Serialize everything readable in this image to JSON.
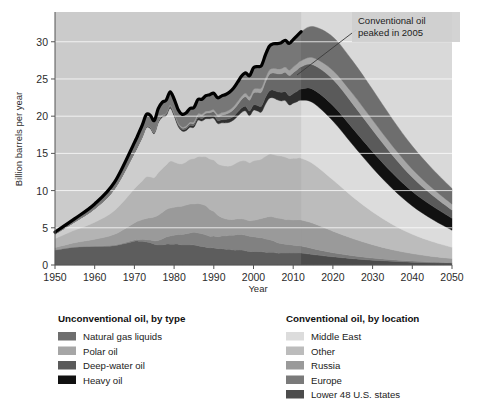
{
  "figure": {
    "background": "#ffffff",
    "plot_background": "#d9d9d9"
  },
  "chart_data": {
    "type": "area",
    "stacking": "stacked",
    "title": "",
    "xlabel": "Year",
    "ylabel": "Billion barrels per year",
    "xlim": [
      1950,
      2050
    ],
    "ylim": [
      0,
      34
    ],
    "xticks": [
      1950,
      1960,
      1970,
      1980,
      1990,
      2000,
      2010,
      2020,
      2030,
      2040,
      2050
    ],
    "yticks": [
      0,
      5,
      10,
      15,
      20,
      25,
      30
    ],
    "grid": "horizontal-white",
    "legend_position": "below-plot-two-columns",
    "x": [
      1950,
      1955,
      1960,
      1965,
      1970,
      1971,
      1972,
      1973,
      1974,
      1975,
      1976,
      1977,
      1978,
      1979,
      1980,
      1981,
      1982,
      1983,
      1984,
      1985,
      1986,
      1987,
      1988,
      1989,
      1990,
      1991,
      1992,
      1993,
      1994,
      1995,
      1996,
      1997,
      1998,
      1999,
      2000,
      2001,
      2002,
      2003,
      2004,
      2005,
      2006,
      2007,
      2008,
      2009,
      2010,
      2011,
      2012,
      2015,
      2020,
      2025,
      2030,
      2035,
      2040,
      2045,
      2050
    ],
    "series": [
      {
        "name": "Lower 48 U.S. states",
        "group": "Conventional oil, by location",
        "color": "#4c4c4c",
        "values": [
          2.0,
          2.4,
          2.5,
          2.6,
          3.2,
          3.2,
          3.2,
          3.1,
          3.0,
          2.8,
          2.7,
          2.7,
          2.8,
          2.8,
          2.8,
          2.8,
          2.7,
          2.7,
          2.7,
          2.7,
          2.6,
          2.5,
          2.4,
          2.3,
          2.3,
          2.2,
          2.2,
          2.1,
          2.1,
          2.0,
          2.0,
          2.0,
          1.9,
          1.8,
          1.8,
          1.8,
          1.8,
          1.7,
          1.7,
          1.7,
          1.6,
          1.6,
          1.6,
          1.6,
          1.6,
          1.6,
          1.6,
          1.4,
          1.1,
          0.85,
          0.65,
          0.5,
          0.38,
          0.3,
          0.25
        ]
      },
      {
        "name": "Europe",
        "group": "Conventional oil, by location",
        "color": "#7a7a7a",
        "values": [
          0.05,
          0.05,
          0.06,
          0.08,
          0.15,
          0.2,
          0.25,
          0.3,
          0.35,
          0.45,
          0.6,
          0.8,
          0.95,
          1.1,
          1.2,
          1.3,
          1.4,
          1.5,
          1.6,
          1.7,
          1.7,
          1.7,
          1.65,
          1.55,
          1.6,
          1.6,
          1.7,
          1.8,
          1.9,
          2.0,
          2.1,
          2.1,
          2.1,
          2.05,
          2.0,
          1.9,
          1.85,
          1.8,
          1.7,
          1.55,
          1.4,
          1.3,
          1.2,
          1.15,
          1.05,
          1.0,
          0.95,
          0.8,
          0.55,
          0.4,
          0.28,
          0.2,
          0.15,
          0.1,
          0.08
        ]
      },
      {
        "name": "Russia",
        "group": "Conventional oil, by location",
        "color": "#9a9a9a",
        "values": [
          0.3,
          0.55,
          0.9,
          1.45,
          2.3,
          2.5,
          2.65,
          2.85,
          3.0,
          3.2,
          3.4,
          3.55,
          3.7,
          3.75,
          3.75,
          3.75,
          3.8,
          3.85,
          3.9,
          3.8,
          3.95,
          3.95,
          3.9,
          3.6,
          3.3,
          2.9,
          2.5,
          2.3,
          2.1,
          2.1,
          2.1,
          2.1,
          2.1,
          2.1,
          2.2,
          2.4,
          2.6,
          2.9,
          3.1,
          3.2,
          3.3,
          3.35,
          3.3,
          3.35,
          3.4,
          3.45,
          3.5,
          3.4,
          2.9,
          2.3,
          1.8,
          1.35,
          1.0,
          0.75,
          0.55
        ]
      },
      {
        "name": "Other",
        "group": "Conventional oil, by location",
        "color": "#bcbcbc",
        "values": [
          1.2,
          1.7,
          2.3,
          3.2,
          4.6,
          4.9,
          5.2,
          5.6,
          5.5,
          5.3,
          5.7,
          5.9,
          6.0,
          6.3,
          6.1,
          5.8,
          5.7,
          5.8,
          6.0,
          6.1,
          6.3,
          6.4,
          6.6,
          6.8,
          6.9,
          6.9,
          7.0,
          7.1,
          7.2,
          7.4,
          7.6,
          7.8,
          7.9,
          7.8,
          8.0,
          8.0,
          8.0,
          8.2,
          8.4,
          8.4,
          8.4,
          8.4,
          8.4,
          8.2,
          8.3,
          8.3,
          8.3,
          8.0,
          6.9,
          5.6,
          4.4,
          3.4,
          2.6,
          2.0,
          1.5
        ]
      },
      {
        "name": "Middle East",
        "group": "Conventional oil, by location",
        "color": "#dcdcdc",
        "values": [
          0.6,
          1.1,
          1.8,
          2.9,
          4.8,
          5.3,
          5.9,
          6.6,
          6.5,
          5.9,
          6.7,
          6.9,
          6.6,
          7.1,
          6.2,
          5.0,
          4.4,
          4.2,
          4.3,
          4.2,
          4.9,
          4.8,
          5.1,
          5.4,
          5.6,
          5.4,
          5.7,
          5.8,
          5.9,
          6.0,
          6.2,
          6.5,
          6.7,
          6.3,
          6.8,
          6.6,
          6.3,
          7.0,
          7.5,
          7.6,
          7.5,
          7.4,
          7.6,
          7.2,
          7.4,
          7.6,
          7.8,
          8.2,
          7.9,
          7.0,
          5.9,
          4.8,
          3.8,
          3.0,
          2.3
        ]
      },
      {
        "name": "Heavy oil",
        "group": "Unconventional oil, by type",
        "color": "#111111",
        "values": [
          0.02,
          0.03,
          0.04,
          0.05,
          0.08,
          0.09,
          0.1,
          0.12,
          0.12,
          0.13,
          0.15,
          0.16,
          0.18,
          0.2,
          0.2,
          0.21,
          0.22,
          0.24,
          0.26,
          0.28,
          0.3,
          0.32,
          0.34,
          0.36,
          0.38,
          0.4,
          0.42,
          0.45,
          0.48,
          0.5,
          0.55,
          0.6,
          0.62,
          0.65,
          0.7,
          0.75,
          0.8,
          0.9,
          1.0,
          1.05,
          1.1,
          1.15,
          1.2,
          1.25,
          1.3,
          1.4,
          1.5,
          1.8,
          2.1,
          2.2,
          2.2,
          2.1,
          1.95,
          1.8,
          1.6
        ]
      },
      {
        "name": "Deep-water oil",
        "group": "Unconventional oil, by type",
        "color": "#5a5a5a",
        "values": [
          0.0,
          0.0,
          0.0,
          0.0,
          0.02,
          0.02,
          0.03,
          0.04,
          0.05,
          0.06,
          0.08,
          0.1,
          0.12,
          0.14,
          0.16,
          0.18,
          0.2,
          0.22,
          0.25,
          0.28,
          0.32,
          0.36,
          0.4,
          0.45,
          0.5,
          0.55,
          0.62,
          0.7,
          0.8,
          0.9,
          1.0,
          1.15,
          1.3,
          1.45,
          1.6,
          1.75,
          1.9,
          2.05,
          2.2,
          2.3,
          2.4,
          2.5,
          2.6,
          2.7,
          2.8,
          2.9,
          3.0,
          3.3,
          3.5,
          3.3,
          2.9,
          2.4,
          1.9,
          1.45,
          1.1
        ]
      },
      {
        "name": "Polar oil",
        "group": "Unconventional oil, by type",
        "color": "#a6a6a6",
        "values": [
          0.0,
          0.0,
          0.0,
          0.0,
          0.0,
          0.0,
          0.0,
          0.0,
          0.01,
          0.02,
          0.03,
          0.05,
          0.06,
          0.08,
          0.1,
          0.12,
          0.14,
          0.16,
          0.18,
          0.2,
          0.22,
          0.24,
          0.26,
          0.28,
          0.3,
          0.32,
          0.34,
          0.36,
          0.38,
          0.4,
          0.42,
          0.44,
          0.46,
          0.48,
          0.5,
          0.52,
          0.55,
          0.58,
          0.6,
          0.62,
          0.65,
          0.68,
          0.7,
          0.72,
          0.75,
          0.78,
          0.8,
          0.95,
          1.2,
          1.35,
          1.35,
          1.25,
          1.1,
          0.95,
          0.8
        ]
      },
      {
        "name": "Natural gas liquids",
        "group": "Unconventional oil, by type",
        "color": "#6e6e6e",
        "values": [
          0.25,
          0.4,
          0.6,
          0.85,
          1.3,
          1.4,
          1.5,
          1.6,
          1.6,
          1.55,
          1.65,
          1.7,
          1.75,
          1.8,
          1.8,
          1.75,
          1.7,
          1.75,
          1.85,
          1.9,
          1.95,
          2.0,
          2.1,
          2.15,
          2.2,
          2.2,
          2.25,
          2.3,
          2.4,
          2.5,
          2.6,
          2.7,
          2.75,
          2.8,
          2.9,
          2.95,
          3.0,
          3.1,
          3.2,
          3.3,
          3.4,
          3.5,
          3.6,
          3.6,
          3.7,
          3.8,
          3.9,
          4.2,
          4.5,
          4.4,
          4.1,
          3.6,
          3.1,
          2.6,
          2.1
        ]
      }
    ],
    "history_line": {
      "name": "total-production-line",
      "color": "#000000",
      "note": "thick black outline tracing total of all layers through 2012"
    },
    "forecast_boundary_year": 2012,
    "annotation": {
      "text_line1": "Conventional oil",
      "text_line2": "peaked in 2005",
      "points_to_year": 2005
    }
  },
  "axes": {
    "ylabel": "Billion barrels per year",
    "xlabel": "Year",
    "yticks": [
      "0",
      "5",
      "10",
      "15",
      "20",
      "25",
      "30"
    ],
    "xticks": [
      "1950",
      "1960",
      "1970",
      "1980",
      "1990",
      "2000",
      "2010",
      "2020",
      "2030",
      "2040",
      "2050"
    ]
  },
  "annotation": {
    "line1": "Conventional oil",
    "line2": "peaked in 2005"
  },
  "legend": {
    "left": {
      "title": "Unconventional oil, by type",
      "items": [
        {
          "label": "Natural gas liquids",
          "color": "#6e6e6e"
        },
        {
          "label": "Polar oil",
          "color": "#a6a6a6"
        },
        {
          "label": "Deep-water oil",
          "color": "#5a5a5a"
        },
        {
          "label": "Heavy oil",
          "color": "#111111"
        }
      ]
    },
    "right": {
      "title": "Conventional oil, by location",
      "items": [
        {
          "label": "Middle East",
          "color": "#dcdcdc"
        },
        {
          "label": "Other",
          "color": "#bcbcbc"
        },
        {
          "label": "Russia",
          "color": "#9a9a9a"
        },
        {
          "label": "Europe",
          "color": "#7a7a7a"
        },
        {
          "label": "Lower 48 U.S. states",
          "color": "#4c4c4c"
        }
      ]
    }
  }
}
